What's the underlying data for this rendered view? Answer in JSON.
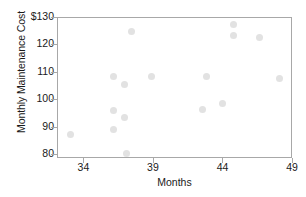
{
  "chart_data": {
    "type": "scatter",
    "title": "",
    "xlabel": "Months",
    "ylabel": "Monthly Maintenance Cost",
    "xlim": [
      32.1,
      49.0
    ],
    "ylim": [
      78.6,
      130.0
    ],
    "xticks": [
      "34",
      "39",
      "44",
      "49"
    ],
    "xtick_values": [
      34,
      39,
      44,
      49
    ],
    "yticks": [
      "$130",
      "120",
      "110",
      "100",
      "90",
      "80"
    ],
    "ytick_values": [
      130,
      120,
      110,
      100,
      90,
      80
    ],
    "grid": false,
    "legend": null,
    "point_color": "#e2e2e2",
    "frame_color": "#a8a8a8",
    "x": [
      33.0,
      36.1,
      36.1,
      36.1,
      36.9,
      36.9,
      37.0,
      37.4,
      38.8,
      42.5,
      42.8,
      43.9,
      44.7,
      44.7,
      46.6,
      48.0
    ],
    "y": [
      87.4,
      108.5,
      96.4,
      89.5,
      105.6,
      93.6,
      80.5,
      125.0,
      108.5,
      96.7,
      108.5,
      99.0,
      127.7,
      123.5,
      123.0,
      108.0
    ],
    "points": [
      {
        "x": 33.0,
        "y": 87.4
      },
      {
        "x": 36.1,
        "y": 108.5
      },
      {
        "x": 36.1,
        "y": 96.4
      },
      {
        "x": 36.1,
        "y": 89.5
      },
      {
        "x": 36.9,
        "y": 105.6
      },
      {
        "x": 36.9,
        "y": 93.6
      },
      {
        "x": 37.0,
        "y": 80.5
      },
      {
        "x": 37.4,
        "y": 125.0
      },
      {
        "x": 38.8,
        "y": 108.5
      },
      {
        "x": 42.5,
        "y": 96.7
      },
      {
        "x": 42.8,
        "y": 108.5
      },
      {
        "x": 43.9,
        "y": 99.0
      },
      {
        "x": 44.7,
        "y": 127.7
      },
      {
        "x": 44.7,
        "y": 123.5
      },
      {
        "x": 46.6,
        "y": 123.0
      },
      {
        "x": 48.0,
        "y": 108.0
      }
    ]
  }
}
